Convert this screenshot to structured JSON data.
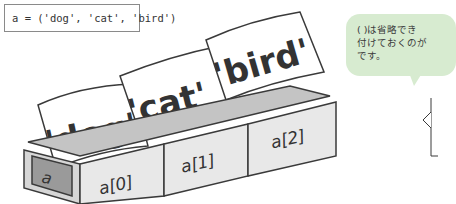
{
  "code": {
    "line": "a = ('dog', 'cat', 'bird')"
  },
  "illustration": {
    "variable_label": "a",
    "boxes": [
      {
        "index_label": "a[0]",
        "card_text": "'dog'"
      },
      {
        "index_label": "a[1]",
        "card_text": "'cat'"
      },
      {
        "index_label": "a[2]",
        "card_text": "'bird'"
      }
    ]
  },
  "note": {
    "text": "( )は省略でき\n付けておくのが\nです。"
  },
  "colors": {
    "box_face": "#e8e8e8",
    "box_side": "#b9b9b9",
    "label_panel": "#9a9a9a",
    "bubble": "#d7ebd0",
    "outline": "#3a3a3a"
  }
}
